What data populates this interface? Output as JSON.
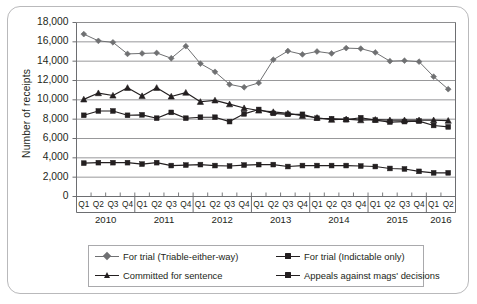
{
  "chart_data": {
    "type": "line",
    "title": "",
    "xlabel": "",
    "ylabel": "Number of receipts",
    "ylim": [
      0,
      18000
    ],
    "ytick_step": 2000,
    "grid": true,
    "legend_position": "bottom",
    "ytick_labels": [
      "18,000",
      "16,000",
      "14,000",
      "12,000",
      "10,000",
      "8,000",
      "6,000",
      "4,000",
      "2,000",
      "0"
    ],
    "ytick_values": [
      18000,
      16000,
      14000,
      12000,
      10000,
      8000,
      6000,
      4000,
      2000,
      0
    ],
    "quarter_labels": [
      "Q1",
      "Q2",
      "Q3",
      "Q4",
      "Q1",
      "Q2",
      "Q3",
      "Q4",
      "Q1",
      "Q2",
      "Q3",
      "Q4",
      "Q1",
      "Q2",
      "Q3",
      "Q4",
      "Q1",
      "Q2",
      "Q3",
      "Q4",
      "Q1",
      "Q2",
      "Q3",
      "Q4",
      "Q1",
      "Q2"
    ],
    "year_groups": [
      {
        "label": "2010",
        "quarters": 4
      },
      {
        "label": "2011",
        "quarters": 4
      },
      {
        "label": "2012",
        "quarters": 4
      },
      {
        "label": "2013",
        "quarters": 4
      },
      {
        "label": "2014",
        "quarters": 4
      },
      {
        "label": "2015",
        "quarters": 4
      },
      {
        "label": "2016",
        "quarters": 2
      }
    ],
    "categories": [
      "Q1 2010",
      "Q2 2010",
      "Q3 2010",
      "Q4 2010",
      "Q1 2011",
      "Q2 2011",
      "Q3 2011",
      "Q4 2011",
      "Q1 2012",
      "Q2 2012",
      "Q3 2012",
      "Q4 2012",
      "Q1 2013",
      "Q2 2013",
      "Q3 2013",
      "Q4 2013",
      "Q1 2014",
      "Q2 2014",
      "Q3 2014",
      "Q4 2014",
      "Q1 2015",
      "Q2 2015",
      "Q3 2015",
      "Q4 2015",
      "Q1 2016",
      "Q2 2016"
    ],
    "series": [
      {
        "name": "For trial (Triable-either-way)",
        "marker": "diamond",
        "color": "#6f7072",
        "values": [
          16800,
          16100,
          15950,
          14750,
          14800,
          14850,
          14300,
          15550,
          13750,
          12900,
          11600,
          11300,
          11750,
          14150,
          15050,
          14700,
          15000,
          14800,
          15350,
          15300,
          14900,
          14000,
          14050,
          13950,
          12400,
          11100
        ]
      },
      {
        "name": "For trial (Indictable only)",
        "marker": "square",
        "color": "#231f20",
        "values": [
          8400,
          8850,
          8850,
          8400,
          8450,
          8100,
          8700,
          8100,
          8200,
          8200,
          7750,
          8550,
          9000,
          8600,
          8500,
          8500,
          8100,
          8050,
          7950,
          8150,
          7900,
          7700,
          7750,
          7800,
          7350,
          7200
        ]
      },
      {
        "name": "Committed for sentence",
        "marker": "triangle",
        "color": "#231f20",
        "values": [
          10050,
          10700,
          10450,
          11250,
          10400,
          11250,
          10350,
          10750,
          9800,
          9950,
          9550,
          9150,
          8900,
          8750,
          8600,
          8350,
          8150,
          7950,
          8000,
          7900,
          7950,
          7900,
          7900,
          7900,
          7900,
          7850
        ]
      },
      {
        "name": "Appeals against mags' decisions",
        "marker": "square",
        "color": "#231f20",
        "values": [
          3450,
          3500,
          3500,
          3500,
          3350,
          3500,
          3200,
          3250,
          3300,
          3200,
          3150,
          3250,
          3300,
          3300,
          3100,
          3200,
          3200,
          3200,
          3200,
          3150,
          3100,
          2900,
          2850,
          2600,
          2450,
          2450
        ]
      }
    ]
  },
  "legend": {
    "items": [
      {
        "label": "For trial (Triable-either-way)",
        "marker": "diamond",
        "color": "#6f7072"
      },
      {
        "label": "For trial (Indictable only)",
        "marker": "square",
        "color": "#231f20"
      },
      {
        "label": "Committed for sentence",
        "marker": "triangle",
        "color": "#231f20"
      },
      {
        "label": "Appeals against mags' decisions",
        "marker": "square",
        "color": "#231f20"
      }
    ]
  },
  "style": {
    "grid_color": "#8c8c8e",
    "axis_color": "#6d6e71",
    "frame_color": "#b9b9bb",
    "text_color": "#231f20"
  }
}
